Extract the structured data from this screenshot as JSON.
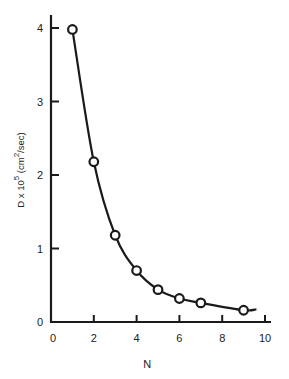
{
  "chart_data": {
    "type": "line",
    "title": "",
    "xlabel": "N",
    "ylabel": "D × 10^5 (cm^2/sec)",
    "ylabel_parts": {
      "base": "D x 10",
      "exp1": "5",
      "unit_open": " (cm",
      "exp2": "2",
      "unit_close": "/sec)"
    },
    "xlim": [
      0,
      10
    ],
    "ylim": [
      0,
      4
    ],
    "x_ticks": [
      0,
      2,
      4,
      6,
      8,
      10
    ],
    "y_ticks": [
      0,
      1,
      2,
      3,
      4
    ],
    "grid": false,
    "legend": null,
    "series": [
      {
        "name": "D vs N",
        "marker": "open-circle",
        "line": "smooth-fit",
        "x": [
          1,
          2,
          3,
          4,
          5,
          6,
          7,
          9
        ],
        "y": [
          3.98,
          2.18,
          1.18,
          0.7,
          0.44,
          0.32,
          0.26,
          0.16
        ]
      }
    ],
    "curve_end_x": 9.6
  },
  "colors": {
    "ink": "#1a1a1a",
    "background": "#ffffff"
  }
}
